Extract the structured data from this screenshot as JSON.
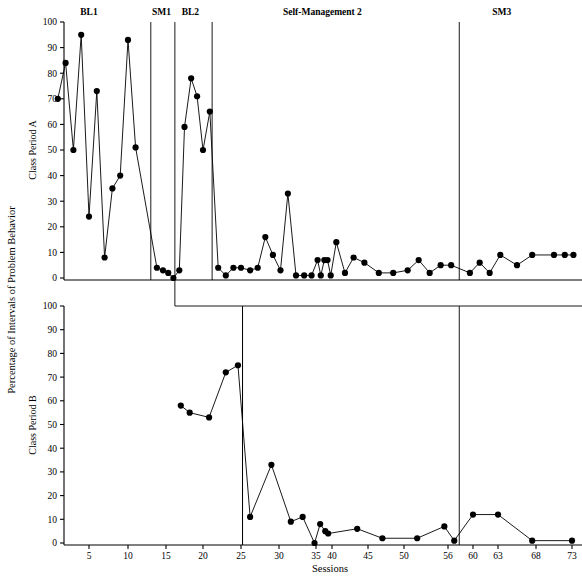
{
  "chart_data": {
    "type": "line",
    "title": "",
    "xlabel": "Sessions",
    "ylabel": "Percentage of Intervals of Problem Behavior",
    "ylim": [
      0,
      100
    ],
    "xlim": [
      0,
      75
    ],
    "grid": false,
    "legend": null,
    "yticks": [
      0,
      10,
      20,
      30,
      40,
      50,
      60,
      70,
      80,
      90,
      100
    ],
    "xticks": [
      5,
      10,
      15,
      20,
      25,
      30,
      35,
      40,
      45,
      50,
      56,
      60,
      63,
      68,
      73
    ],
    "panels": [
      {
        "name": "Class Period A",
        "panel_label": "Class Period A",
        "phase_labels": [
          {
            "text": "BL1",
            "x": 5
          },
          {
            "text": "SM1",
            "x": 14.4
          },
          {
            "text": "BL2",
            "x": 18.3
          },
          {
            "text": "Self-Management 2",
            "x": 37
          },
          {
            "text": "SM3",
            "x": 63.5
          }
        ],
        "phase_lines": [
          13,
          16.2,
          21.2,
          57.8
        ],
        "series": [
          {
            "name": "Class Period A",
            "points": [
              {
                "x": 1,
                "y": 70
              },
              {
                "x": 2,
                "y": 84
              },
              {
                "x": 3,
                "y": 50
              },
              {
                "x": 4,
                "y": 95
              },
              {
                "x": 5,
                "y": 24
              },
              {
                "x": 6,
                "y": 73
              },
              {
                "x": 7,
                "y": 8
              },
              {
                "x": 8,
                "y": 35
              },
              {
                "x": 9,
                "y": 40
              },
              {
                "x": 10,
                "y": 93
              },
              {
                "x": 11,
                "y": 51
              },
              {
                "x": 13.8,
                "y": 4
              },
              {
                "x": 14.6,
                "y": 3
              },
              {
                "x": 15.3,
                "y": 2
              },
              {
                "x": 16.0,
                "y": 0
              },
              {
                "x": 16.8,
                "y": 3
              },
              {
                "x": 17.5,
                "y": 59
              },
              {
                "x": 18.4,
                "y": 78
              },
              {
                "x": 19.2,
                "y": 71
              },
              {
                "x": 20.0,
                "y": 50
              },
              {
                "x": 20.9,
                "y": 65
              },
              {
                "x": 22.0,
                "y": 4
              },
              {
                "x": 23.0,
                "y": 1
              },
              {
                "x": 24.0,
                "y": 4
              },
              {
                "x": 25.0,
                "y": 4
              },
              {
                "x": 26.2,
                "y": 3
              },
              {
                "x": 27.2,
                "y": 4
              },
              {
                "x": 28.2,
                "y": 16
              },
              {
                "x": 29.2,
                "y": 9
              },
              {
                "x": 30.2,
                "y": 3
              },
              {
                "x": 31.2,
                "y": 33
              },
              {
                "x": 32.3,
                "y": 1
              },
              {
                "x": 33.4,
                "y": 1
              },
              {
                "x": 34.4,
                "y": 1
              },
              {
                "x": 35.5,
                "y": 7
              },
              {
                "x": 36.5,
                "y": 1
              },
              {
                "x": 37.6,
                "y": 7
              },
              {
                "x": 38.6,
                "y": 7
              },
              {
                "x": 39.6,
                "y": 1
              },
              {
                "x": 40.6,
                "y": 14
              },
              {
                "x": 41.8,
                "y": 2
              },
              {
                "x": 43.0,
                "y": 8
              },
              {
                "x": 44.5,
                "y": 6
              },
              {
                "x": 46.5,
                "y": 2
              },
              {
                "x": 48.5,
                "y": 2
              },
              {
                "x": 50.5,
                "y": 3
              },
              {
                "x": 52.0,
                "y": 7
              },
              {
                "x": 53.5,
                "y": 2
              },
              {
                "x": 55.0,
                "y": 5
              },
              {
                "x": 56.5,
                "y": 5
              },
              {
                "x": 59.5,
                "y": 2
              },
              {
                "x": 60.8,
                "y": 6
              },
              {
                "x": 62.0,
                "y": 2
              },
              {
                "x": 63.3,
                "y": 9
              },
              {
                "x": 65.5,
                "y": 5
              },
              {
                "x": 67.5,
                "y": 9
              },
              {
                "x": 70.5,
                "y": 9
              },
              {
                "x": 72.0,
                "y": 9
              },
              {
                "x": 73.2,
                "y": 9
              }
            ]
          }
        ]
      },
      {
        "name": "Class Period B",
        "panel_label": "Class Period B",
        "phase_labels": [],
        "phase_lines": [
          25.2,
          57.8
        ],
        "series": [
          {
            "name": "Class Period B",
            "points": [
              {
                "x": 17.0,
                "y": 58
              },
              {
                "x": 18.2,
                "y": 55
              },
              {
                "x": 20.8,
                "y": 53
              },
              {
                "x": 23.0,
                "y": 72
              },
              {
                "x": 24.6,
                "y": 75
              },
              {
                "x": 26.2,
                "y": 11
              },
              {
                "x": 29.0,
                "y": 33
              },
              {
                "x": 31.6,
                "y": 9
              },
              {
                "x": 33.2,
                "y": 11
              },
              {
                "x": 34.8,
                "y": 0
              },
              {
                "x": 36.3,
                "y": 8
              },
              {
                "x": 37.9,
                "y": 5
              },
              {
                "x": 38.8,
                "y": 4
              },
              {
                "x": 43.5,
                "y": 6
              },
              {
                "x": 47.0,
                "y": 2
              },
              {
                "x": 51.8,
                "y": 2
              },
              {
                "x": 55.5,
                "y": 7
              },
              {
                "x": 57.0,
                "y": 1
              },
              {
                "x": 60.0,
                "y": 12
              },
              {
                "x": 63.0,
                "y": 12
              },
              {
                "x": 67.5,
                "y": 1
              },
              {
                "x": 73.0,
                "y": 1
              }
            ]
          }
        ]
      }
    ]
  }
}
